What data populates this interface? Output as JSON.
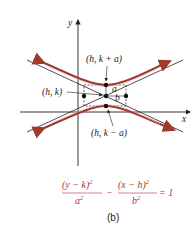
{
  "figure": {
    "axes": {
      "x_label": "x",
      "y_label": "y"
    },
    "points": {
      "center": "(h, k)",
      "upper_vertex": "(h, k + a)",
      "lower_vertex": "(h, k − a)"
    },
    "segment_labels": {
      "a": "a",
      "b": "b"
    },
    "equation": {
      "num1": "(y − k)",
      "num1_exp": "2",
      "den1": "a",
      "den1_exp": "2",
      "minus": "−",
      "num2": "(x − h)",
      "num2_exp": "2",
      "den2": "b",
      "den2_exp": "2",
      "rhs": "= 1"
    },
    "caption": "(b)",
    "colors": {
      "curve": "#a0392e",
      "curve_highlight": "#e8b4a8",
      "axes": "#222222",
      "equation": "#b0303a"
    }
  }
}
